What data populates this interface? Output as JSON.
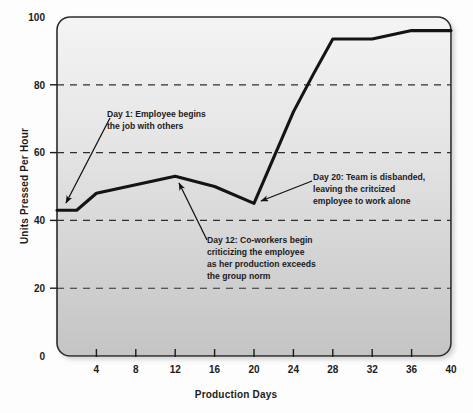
{
  "chart_data": {
    "type": "line",
    "title": "",
    "xlabel": "Production Days",
    "ylabel": "Units Pressed Per Hour",
    "xlim": [
      0,
      40
    ],
    "ylim": [
      0,
      100
    ],
    "xticks": [
      4,
      8,
      12,
      16,
      20,
      24,
      28,
      32,
      36,
      40
    ],
    "yticks": [
      0,
      20,
      40,
      60,
      80,
      100
    ],
    "grid": "horizontal-dashed",
    "legend": "none",
    "series": [
      {
        "name": "Units pressed per hour",
        "x": [
          0,
          2,
          4,
          12,
          16,
          20,
          24,
          26,
          28,
          32,
          36,
          40
        ],
        "values": [
          43,
          43,
          48,
          53,
          50,
          45,
          72,
          83,
          93.5,
          93.5,
          96,
          96
        ]
      }
    ],
    "annotations": [
      {
        "id": "day-1",
        "lines": [
          "Day 1: Employee begins",
          "the job with others"
        ],
        "target_x": 0.6,
        "target_y": 44
      },
      {
        "id": "day-12",
        "lines": [
          "Day 12: Co-workers begin",
          "criticizing the employee",
          "as her production exceeds",
          "the group norm"
        ],
        "target_x": 12.3,
        "target_y": 52
      },
      {
        "id": "day-20",
        "lines": [
          "Day 20: Team is disbanded,",
          "leaving the critcized",
          "employee to work alone"
        ],
        "target_x": 20.6,
        "target_y": 45
      }
    ],
    "colors": {
      "line": "#1a1a1a",
      "plot_background_top": "#f2f2f2",
      "plot_background_bottom": "#c9c9c9",
      "grid": "#333333",
      "text": "#1b1b1b"
    }
  }
}
